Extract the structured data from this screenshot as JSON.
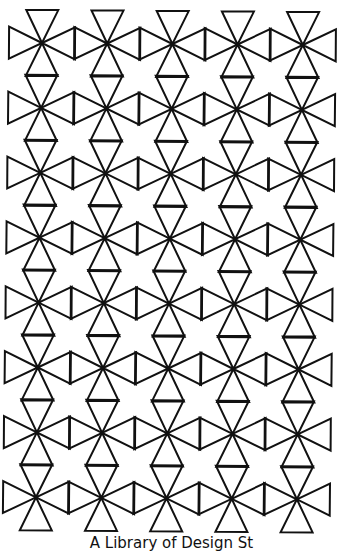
{
  "pattern": {
    "name": "tiled-bowtie-star-pattern",
    "rows": 8,
    "cols": 5,
    "origin": [
      42,
      43
    ],
    "col_step": [
      65.2,
      0.5
    ],
    "row_step": [
      -0.85,
      64.9
    ],
    "triangle_height": 33,
    "triangle_half_base": 16,
    "stroke_color": "#111111",
    "stroke_width": 2,
    "background": "#ffffff"
  },
  "caption": {
    "text": "A Library of Design St"
  }
}
